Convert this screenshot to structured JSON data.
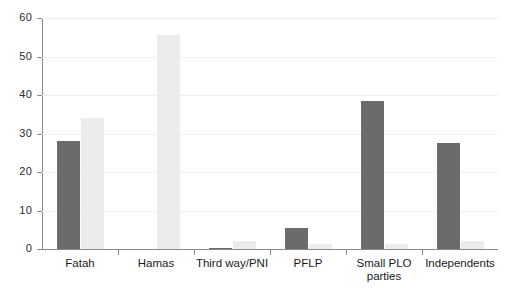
{
  "chart_data": {
    "type": "bar",
    "title": "",
    "subtitle": "",
    "xlabel": "",
    "ylabel": "",
    "ylim": [
      0,
      60
    ],
    "yticks": [
      0,
      10,
      20,
      30,
      40,
      50,
      60
    ],
    "ytick_labels": [
      "0",
      "10",
      "20",
      "30",
      "40",
      "50",
      "60"
    ],
    "grid": true,
    "grid_axis": "y",
    "legend": false,
    "legend_position": "none",
    "categories": [
      "Fatah",
      "Hamas",
      "Third way/PNI",
      "PFLP",
      "Small PLO parties",
      "Independents"
    ],
    "category_lines": [
      [
        "Fatah"
      ],
      [
        "Hamas"
      ],
      [
        "Third way/PNI"
      ],
      [
        "PFLP"
      ],
      [
        "Small PLO",
        "parties"
      ],
      [
        "Independents"
      ]
    ],
    "series": [
      {
        "name": "series-1",
        "color": "#6b6b6b",
        "values": [
          28,
          0,
          0.3,
          5.5,
          38.5,
          27.5
        ]
      },
      {
        "name": "series-2",
        "color": "#ececec",
        "values": [
          34,
          55.5,
          2,
          1.3,
          1.3,
          2
        ]
      }
    ]
  },
  "colors": {
    "series_dark": "#6b6b6b",
    "series_light": "#ececec",
    "axis": "#8a8a8a",
    "grid": "#efefef",
    "text": "#1a1a1a",
    "background": "#ffffff"
  }
}
